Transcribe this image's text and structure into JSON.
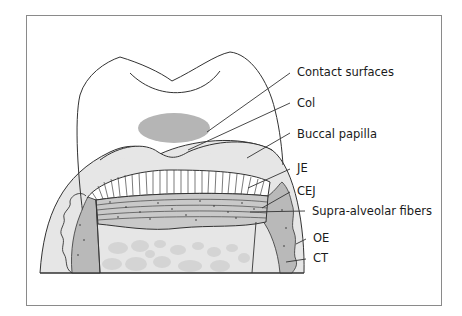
{
  "figure": {
    "labels": [
      {
        "id": "contact-surfaces",
        "text": "Contact surfaces",
        "x": 297,
        "y": 76
      },
      {
        "id": "col",
        "text": "Col",
        "x": 297,
        "y": 107
      },
      {
        "id": "buccal-papilla",
        "text": "Buccal papilla",
        "x": 297,
        "y": 138
      },
      {
        "id": "je",
        "text": "JE",
        "x": 297,
        "y": 172
      },
      {
        "id": "cej",
        "text": "CEJ",
        "x": 297,
        "y": 195
      },
      {
        "id": "supra-alveolar-fibers",
        "text": "Supra-alveolar fibers",
        "x": 312,
        "y": 215
      },
      {
        "id": "oe",
        "text": "OE",
        "x": 313,
        "y": 242
      },
      {
        "id": "ct",
        "text": "CT",
        "x": 313,
        "y": 262
      }
    ],
    "colors": {
      "frame": "#8a8a8a",
      "outline": "#333333",
      "papilla_fill": "#e6e6e6",
      "ct_fill": "#b9b9b9",
      "col_fill": "#b5b5b5",
      "bone_fill": "#d4d4d4",
      "fiber_band": "#c9c9c9"
    }
  }
}
